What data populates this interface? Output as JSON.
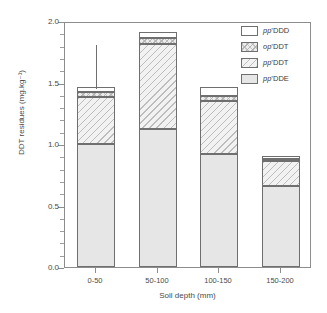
{
  "chart_data": {
    "type": "bar",
    "subtype": "stacked",
    "title": "",
    "xlabel": "Soil depth (mm)",
    "ylabel": "DDT residues (mg.kg⁻¹)",
    "categories": [
      "0-50",
      "50-100",
      "100-150",
      "150-200"
    ],
    "ylim": [
      0.0,
      2.0
    ],
    "ytick_labels": [
      "0.0",
      "0.5",
      "1.0",
      "1.5",
      "2.0"
    ],
    "ytick_values": [
      0.0,
      0.5,
      1.0,
      1.5,
      2.0
    ],
    "yminor_step": 0.1,
    "grid": false,
    "legend_position": "top-right",
    "series": [
      {
        "name": "pp'DDE",
        "pattern": "stipple",
        "values": [
          1.0,
          1.12,
          0.92,
          0.66
        ]
      },
      {
        "name": "pp'DDT",
        "pattern": "diagonal-hatch",
        "values": [
          0.38,
          0.69,
          0.43,
          0.2
        ]
      },
      {
        "name": "op'DDT",
        "pattern": "cross-hatch",
        "values": [
          0.04,
          0.05,
          0.04,
          0.02
        ]
      },
      {
        "name": "pp'DDD",
        "pattern": "solid-white",
        "values": [
          0.04,
          0.05,
          0.07,
          0.02
        ]
      }
    ],
    "totals": [
      1.46,
      1.91,
      1.46,
      0.9
    ],
    "error_bars": [
      {
        "category": "0-50",
        "upper": 1.82
      }
    ]
  },
  "legend": {
    "entries": [
      {
        "prefix": "pp",
        "prime": "’",
        "suffix": "DDD"
      },
      {
        "prefix": "op",
        "prime": "’",
        "suffix": "DDT"
      },
      {
        "prefix": "pp",
        "prime": "’",
        "suffix": "DDT"
      },
      {
        "prefix": "pp",
        "prime": "’",
        "suffix": "DDE"
      }
    ],
    "labels": [
      "pp’DDD",
      "op’DDT",
      "pp’DDT",
      "pp’DDE"
    ]
  },
  "axes": {
    "y_title": "DDT residues (mg.kg⁻¹)",
    "x_title": "Soil depth (mm)"
  },
  "colors": {
    "axis": "#8d8d8d",
    "bar_outline": "#6f6f6f",
    "text": "#3a3a3a",
    "background": "#ffffff"
  }
}
